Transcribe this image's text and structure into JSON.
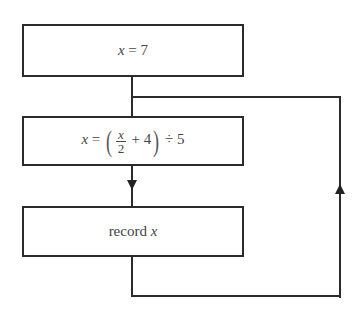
{
  "diagram": {
    "type": "flowchart",
    "boxes": [
      {
        "id": "init",
        "var": "x",
        "eq": "=",
        "value": "7",
        "label": "x = 7"
      },
      {
        "id": "compute",
        "label": "x = (x/2 + 4) ÷ 5",
        "var": "x",
        "eq": "=",
        "frac_num": "x",
        "frac_den": "2",
        "lparen": "(",
        "plus": "+ 4",
        "rparen": ")",
        "tail": "÷ 5"
      },
      {
        "id": "record",
        "label": "record x",
        "word": "record",
        "var": "x"
      }
    ],
    "connectors": [
      {
        "from": "init",
        "to": "compute",
        "arrow": false
      },
      {
        "from": "compute",
        "to": "record",
        "arrow": "down"
      },
      {
        "from": "record",
        "to": "compute",
        "via": "right-loop",
        "arrow": "up"
      }
    ]
  }
}
